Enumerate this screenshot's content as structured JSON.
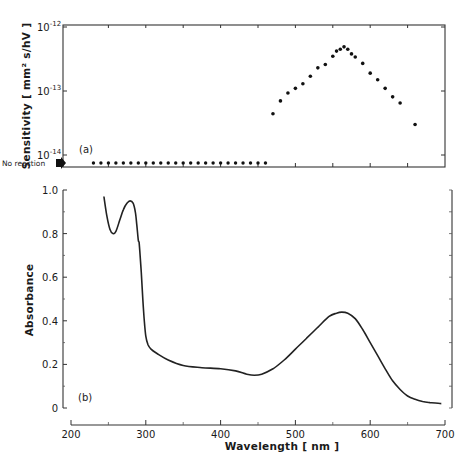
{
  "chart_data": [
    {
      "type": "scatter",
      "panel": "(a)",
      "ylabel": "Sensitivity  [ mm² s/hV ]",
      "yscale": "log",
      "ylim": [
        1e-14,
        1e-12
      ],
      "yticks": [
        {
          "value": 1e-12,
          "base": "10",
          "exp": "-12"
        },
        {
          "value": 1e-13,
          "base": "10",
          "exp": "-13"
        },
        {
          "value": 1e-14,
          "base": "10",
          "exp": "-14"
        }
      ],
      "xlim": [
        200,
        700
      ],
      "no_reaction_label": "No reaction",
      "no_reaction_x": [
        230,
        240,
        250,
        260,
        270,
        280,
        290,
        300,
        310,
        320,
        330,
        340,
        350,
        360,
        370,
        380,
        390,
        400,
        410,
        420,
        430,
        440,
        450,
        460
      ],
      "series": [
        {
          "name": "sensitivity",
          "x": [
            470,
            480,
            490,
            500,
            510,
            520,
            530,
            540,
            550,
            555,
            560,
            565,
            570,
            575,
            580,
            590,
            600,
            610,
            620,
            630,
            640,
            660
          ],
          "y": [
            4.4e-14,
            7e-14,
            9.3e-14,
            1.1e-13,
            1.3e-13,
            1.7e-13,
            2.3e-13,
            2.6e-13,
            3.5e-13,
            4.2e-13,
            4.5e-13,
            4.9e-13,
            4.5e-13,
            3.8e-13,
            3.4e-13,
            2.7e-13,
            1.9e-13,
            1.5e-13,
            1.1e-13,
            8.1e-14,
            6.5e-14,
            3e-14
          ]
        }
      ]
    },
    {
      "type": "line",
      "panel": "(b)",
      "ylabel": "Absorbance",
      "xlabel": "Wavelength  [ nm ]",
      "ylim": [
        0,
        1.0
      ],
      "yticks": [
        "0",
        "0.2",
        "0.4",
        "0.6",
        "0.8",
        "1.0"
      ],
      "ytick_values": [
        0,
        0.2,
        0.4,
        0.6,
        0.8,
        1.0
      ],
      "xlim": [
        200,
        700
      ],
      "xticks": [
        "200",
        "300",
        "400",
        "500",
        "600",
        "700"
      ],
      "xtick_values": [
        200,
        300,
        400,
        500,
        600,
        700
      ],
      "grid": false,
      "series": [
        {
          "name": "absorbance",
          "x": [
            244,
            248,
            252,
            256,
            260,
            265,
            270,
            275,
            279,
            283,
            286,
            288,
            290,
            291,
            292,
            294,
            296,
            298,
            300,
            303,
            307,
            315,
            330,
            350,
            375,
            400,
            420,
            435,
            445,
            455,
            470,
            485,
            500,
            515,
            530,
            545,
            555,
            562,
            570,
            580,
            590,
            600,
            610,
            620,
            630,
            640,
            650,
            660,
            670,
            680,
            695
          ],
          "y": [
            0.97,
            0.88,
            0.82,
            0.8,
            0.81,
            0.86,
            0.91,
            0.94,
            0.95,
            0.94,
            0.9,
            0.84,
            0.77,
            0.76,
            0.72,
            0.62,
            0.5,
            0.4,
            0.33,
            0.29,
            0.27,
            0.25,
            0.22,
            0.195,
            0.185,
            0.18,
            0.17,
            0.155,
            0.15,
            0.155,
            0.18,
            0.22,
            0.27,
            0.32,
            0.37,
            0.42,
            0.435,
            0.44,
            0.435,
            0.41,
            0.36,
            0.3,
            0.24,
            0.18,
            0.125,
            0.085,
            0.055,
            0.04,
            0.03,
            0.025,
            0.02
          ]
        }
      ]
    }
  ]
}
